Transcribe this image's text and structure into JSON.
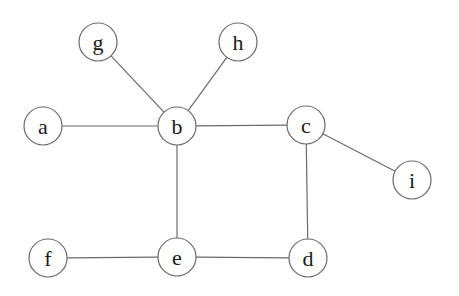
{
  "diagram": {
    "type": "undirected-graph",
    "node_radius": 19,
    "colors": {
      "stroke": "#6a6a6a",
      "label": "#1a1a1a",
      "background": "#ffffff"
    },
    "nodes": [
      {
        "id": "g",
        "label": "g",
        "x": 98,
        "y": 42
      },
      {
        "id": "h",
        "label": "h",
        "x": 238,
        "y": 42
      },
      {
        "id": "a",
        "label": "a",
        "x": 43,
        "y": 126
      },
      {
        "id": "b",
        "label": "b",
        "x": 177,
        "y": 126
      },
      {
        "id": "c",
        "label": "c",
        "x": 306,
        "y": 125
      },
      {
        "id": "i",
        "label": "i",
        "x": 412,
        "y": 180
      },
      {
        "id": "f",
        "label": "f",
        "x": 48,
        "y": 258
      },
      {
        "id": "e",
        "label": "e",
        "x": 177,
        "y": 257
      },
      {
        "id": "d",
        "label": "d",
        "x": 308,
        "y": 258
      }
    ],
    "edges": [
      {
        "from": "g",
        "to": "b"
      },
      {
        "from": "h",
        "to": "b"
      },
      {
        "from": "a",
        "to": "b"
      },
      {
        "from": "b",
        "to": "c"
      },
      {
        "from": "c",
        "to": "i"
      },
      {
        "from": "b",
        "to": "e"
      },
      {
        "from": "c",
        "to": "d"
      },
      {
        "from": "f",
        "to": "e"
      },
      {
        "from": "e",
        "to": "d"
      }
    ]
  }
}
